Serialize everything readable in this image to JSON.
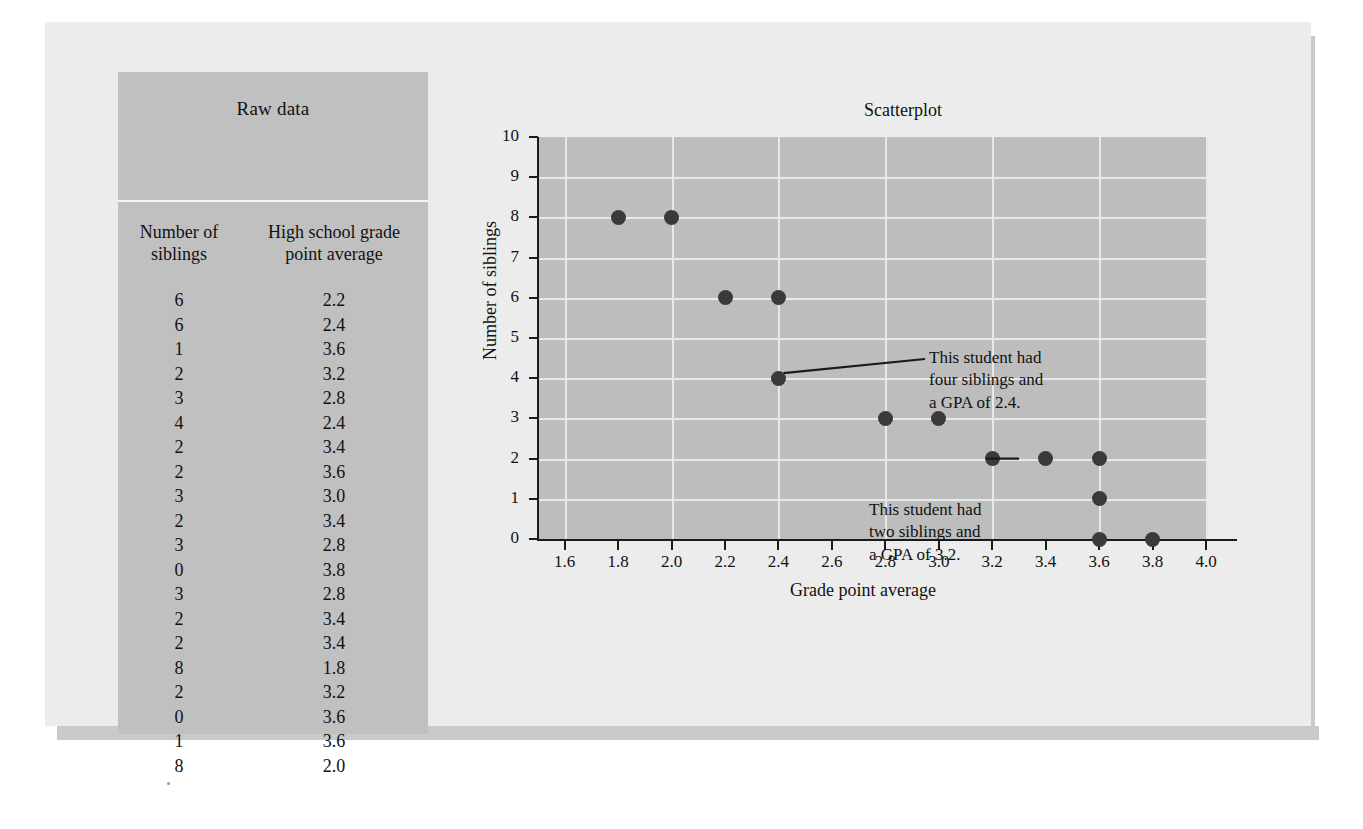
{
  "table": {
    "title": "Raw data",
    "headers": [
      "Number of\nsiblings",
      "High school grade\npoint average"
    ],
    "header1_l1": "Number of",
    "header1_l2": "siblings",
    "header2_l1": "High school grade",
    "header2_l2": "point average",
    "rows": [
      [
        "6",
        "2.2"
      ],
      [
        "6",
        "2.4"
      ],
      [
        "1",
        "3.6"
      ],
      [
        "2",
        "3.2"
      ],
      [
        "3",
        "2.8"
      ],
      [
        "4",
        "2.4"
      ],
      [
        "2",
        "3.4"
      ],
      [
        "2",
        "3.6"
      ],
      [
        "3",
        "3.0"
      ],
      [
        "2",
        "3.4"
      ],
      [
        "3",
        "2.8"
      ],
      [
        "0",
        "3.8"
      ],
      [
        "3",
        "2.8"
      ],
      [
        "2",
        "3.4"
      ],
      [
        "2",
        "3.4"
      ],
      [
        "8",
        "1.8"
      ],
      [
        "2",
        "3.2"
      ],
      [
        "0",
        "3.6"
      ],
      [
        "1",
        "3.6"
      ],
      [
        "8",
        "2.0"
      ]
    ]
  },
  "chart_data": {
    "type": "scatter",
    "title": "Scatterplot",
    "xlabel": "Grade point average",
    "ylabel": "Number of siblings",
    "xlim": [
      1.5,
      4.0
    ],
    "ylim": [
      0,
      10
    ],
    "grid": true,
    "legend": "none",
    "xticks": [
      "1.6",
      "1.8",
      "2.0",
      "2.2",
      "2.4",
      "2.6",
      "2.8",
      "3.0",
      "3.2",
      "3.4",
      "3.6",
      "3.8",
      "4.0"
    ],
    "xtick_values": [
      1.6,
      1.8,
      2.0,
      2.2,
      2.4,
      2.6,
      2.8,
      3.0,
      3.2,
      3.4,
      3.6,
      3.8,
      4.0
    ],
    "yticks": [
      "0",
      "1",
      "2",
      "3",
      "4",
      "5",
      "6",
      "7",
      "8",
      "9",
      "10"
    ],
    "ytick_values": [
      0,
      1,
      2,
      3,
      4,
      5,
      6,
      7,
      8,
      9,
      10
    ],
    "points": [
      {
        "x": 1.8,
        "y": 8
      },
      {
        "x": 2.0,
        "y": 8
      },
      {
        "x": 2.2,
        "y": 6
      },
      {
        "x": 2.4,
        "y": 6
      },
      {
        "x": 2.4,
        "y": 4
      },
      {
        "x": 2.8,
        "y": 3
      },
      {
        "x": 3.0,
        "y": 3
      },
      {
        "x": 3.2,
        "y": 2
      },
      {
        "x": 3.4,
        "y": 2
      },
      {
        "x": 3.6,
        "y": 2
      },
      {
        "x": 3.6,
        "y": 1
      },
      {
        "x": 3.6,
        "y": 0
      },
      {
        "x": 3.8,
        "y": 0
      }
    ],
    "annotations": [
      {
        "text": "This student had\nfour siblings and\na GPA of 2.4.",
        "target": {
          "x": 2.4,
          "y": 4
        }
      },
      {
        "text": "This student had\ntwo siblings and\na GPA of 3.2.",
        "target": {
          "x": 3.2,
          "y": 2
        }
      }
    ]
  },
  "colors": {
    "page_background": "#ffffff",
    "card_background": "#ececec",
    "panel_background": "#c0c0c0",
    "plot_background": "#bdbdbd",
    "gridline": "#e8e8e8",
    "point": "#3a3a3a",
    "axis": "#1a1a1a",
    "text": "#111111",
    "shadow": "#c9c9c9"
  }
}
